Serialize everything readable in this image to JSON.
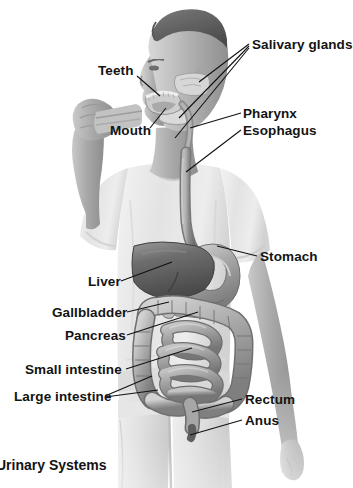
{
  "figure": {
    "background_color": "#ffffff",
    "line_color": "#111111",
    "text_color": "#131313",
    "style": "grayscale halftone photograph with airbrushed organ illustration"
  },
  "caption": {
    "text": "Urinary Systems",
    "note": "clipped at left edge of image"
  },
  "labels": [
    {
      "id": "salivary-glands",
      "text": "Salivary glands",
      "side": "right",
      "x": 252,
      "y": 38
    },
    {
      "id": "teeth",
      "text": "Teeth",
      "side": "left",
      "x": 98,
      "y": 64
    },
    {
      "id": "pharynx",
      "text": "Pharynx",
      "side": "right",
      "x": 243,
      "y": 107
    },
    {
      "id": "mouth",
      "text": "Mouth",
      "side": "left",
      "x": 110,
      "y": 124
    },
    {
      "id": "esophagus",
      "text": "Esophagus",
      "side": "right",
      "x": 243,
      "y": 124
    },
    {
      "id": "stomach",
      "text": "Stomach",
      "side": "right",
      "x": 260,
      "y": 250
    },
    {
      "id": "liver",
      "text": "Liver",
      "side": "left",
      "x": 88,
      "y": 275
    },
    {
      "id": "gallbladder",
      "text": "Gallbladder",
      "side": "left",
      "x": 52,
      "y": 306
    },
    {
      "id": "pancreas",
      "text": "Pancreas",
      "side": "left",
      "x": 65,
      "y": 329
    },
    {
      "id": "small-intestine",
      "text": "Small intestine",
      "side": "left",
      "x": 25,
      "y": 363
    },
    {
      "id": "large-intestine",
      "text": "Large intestine",
      "side": "left",
      "x": 14,
      "y": 390
    },
    {
      "id": "rectum",
      "text": "Rectum",
      "side": "right",
      "x": 245,
      "y": 393
    },
    {
      "id": "anus",
      "text": "Anus",
      "side": "right",
      "x": 245,
      "y": 414
    }
  ],
  "organs": [
    {
      "id": "salivary-glands",
      "name": "Salivary glands"
    },
    {
      "id": "teeth",
      "name": "Teeth"
    },
    {
      "id": "mouth",
      "name": "Mouth"
    },
    {
      "id": "pharynx",
      "name": "Pharynx"
    },
    {
      "id": "esophagus",
      "name": "Esophagus"
    },
    {
      "id": "stomach",
      "name": "Stomach"
    },
    {
      "id": "liver",
      "name": "Liver"
    },
    {
      "id": "gallbladder",
      "name": "Gallbladder"
    },
    {
      "id": "pancreas",
      "name": "Pancreas"
    },
    {
      "id": "small-intestine",
      "name": "Small intestine"
    },
    {
      "id": "large-intestine",
      "name": "Large intestine"
    },
    {
      "id": "rectum",
      "name": "Rectum"
    },
    {
      "id": "anus",
      "name": "Anus"
    }
  ]
}
